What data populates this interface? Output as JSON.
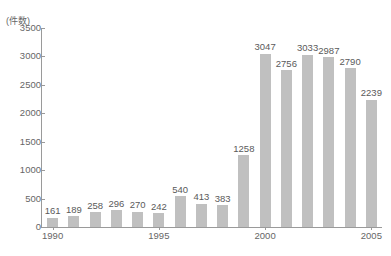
{
  "chart_data": {
    "type": "bar",
    "title": "",
    "subtitle": "",
    "unit_caption": "(件数)",
    "xlabel": "",
    "ylabel": "",
    "ylim": [
      0,
      3500
    ],
    "ytick_values": [
      0,
      500,
      1000,
      1500,
      2000,
      2500,
      3000,
      3500
    ],
    "ytick_labels": [
      "0",
      "500",
      "1000",
      "1500",
      "2000",
      "2500",
      "3000",
      "3500"
    ],
    "grid": false,
    "legend": "none",
    "bar_color": "#c0c0c0",
    "axis_color": "#9a9a9a",
    "text_color": "#666666",
    "categories": [
      "1990",
      "1991",
      "1992",
      "1993",
      "1994",
      "1995",
      "1996",
      "1997",
      "1998",
      "1999",
      "2000",
      "2001",
      "2002",
      "2003",
      "2004",
      "2005"
    ],
    "xtick_labels": [
      "1990",
      "1995",
      "2000",
      "2005"
    ],
    "xtick_categories": [
      "1990",
      "1995",
      "2000",
      "2005"
    ],
    "values": [
      161,
      189,
      258,
      296,
      270,
      242,
      540,
      413,
      383,
      1258,
      3047,
      2756,
      3033,
      2987,
      2790,
      2239
    ],
    "data_labels": [
      "161",
      "189",
      "258",
      "296",
      "270",
      "242",
      "540",
      "413",
      "383",
      "1258",
      "3047",
      "2756",
      "3033",
      "2987",
      "2790",
      "2239"
    ],
    "points": [
      {
        "x": "1990",
        "y": 161
      },
      {
        "x": "1991",
        "y": 189
      },
      {
        "x": "1992",
        "y": 258
      },
      {
        "x": "1993",
        "y": 296
      },
      {
        "x": "1994",
        "y": 270
      },
      {
        "x": "1995",
        "y": 242
      },
      {
        "x": "1996",
        "y": 540
      },
      {
        "x": "1997",
        "y": 413
      },
      {
        "x": "1998",
        "y": 383
      },
      {
        "x": "1999",
        "y": 1258
      },
      {
        "x": "2000",
        "y": 3047
      },
      {
        "x": "2001",
        "y": 2756
      },
      {
        "x": "2002",
        "y": 3033
      },
      {
        "x": "2003",
        "y": 2987
      },
      {
        "x": "2004",
        "y": 2790
      },
      {
        "x": "2005",
        "y": 2239
      }
    ]
  }
}
